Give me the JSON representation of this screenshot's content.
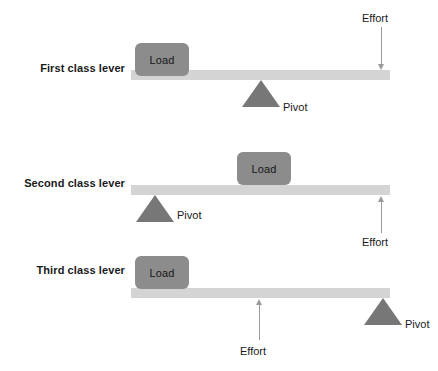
{
  "figure": {
    "cropped_top_caption": "",
    "colors": {
      "background": "#ffffff",
      "beam": "#d4d4d4",
      "load_block": "#8c8c8c",
      "pivot": "#777777",
      "arrow": "#9a9a9a",
      "text": "#1a1a1a"
    }
  },
  "levers": [
    {
      "label": "First class lever",
      "load_label": "Load",
      "pivot_label": "Pivot",
      "effort_label": "Effort",
      "effort_direction": "down",
      "order": "load-pivot-effort"
    },
    {
      "label": "Second class lever",
      "load_label": "Load",
      "pivot_label": "Pivot",
      "effort_label": "Effort",
      "effort_direction": "up",
      "order": "pivot-load-effort"
    },
    {
      "label": "Third class lever",
      "load_label": "Load",
      "pivot_label": "Pivot",
      "effort_label": "Effort",
      "effort_direction": "up",
      "order": "load-effort-pivot"
    }
  ]
}
